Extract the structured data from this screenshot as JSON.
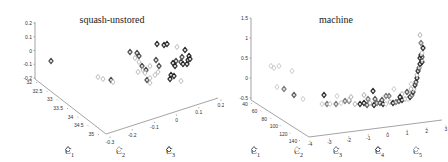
{
  "chart_data": [
    {
      "type": "scatter",
      "subtype": "3d-scatter",
      "title": "squash-unstored",
      "axes": {
        "z": {
          "ticks": [
            "0.2",
            "0.1",
            "0",
            "-0.1",
            "-0.2"
          ],
          "range": [
            -0.2,
            0.2
          ]
        },
        "x": {
          "ticks": [
            "32",
            "32.5",
            "33",
            "33.5",
            "34",
            "34.5",
            "35"
          ],
          "range": [
            32,
            35
          ]
        },
        "y": {
          "ticks": [
            "-0.3",
            "-0.2",
            "-0.1",
            "0",
            "0.1",
            "0.2"
          ],
          "range": [
            -0.3,
            0.2
          ]
        }
      },
      "legend": [
        {
          "label": "C",
          "sub": "1",
          "color": "#444444"
        },
        {
          "label": "C",
          "sub": "2",
          "color": "#aaaaaa"
        },
        {
          "label": "C",
          "sub": "3",
          "color": "#222222"
        }
      ],
      "grid": false
    },
    {
      "type": "scatter",
      "subtype": "3d-scatter",
      "title": "machine",
      "axes": {
        "z": {
          "ticks": [
            "1.5",
            "1",
            "0.5",
            "0",
            "-0.5"
          ],
          "range": [
            -0.5,
            1.5
          ]
        },
        "x": {
          "ticks": [
            "40",
            "60",
            "80",
            "100",
            "120",
            "140"
          ],
          "range": [
            40,
            140
          ]
        },
        "y": {
          "ticks": [
            "-4",
            "-3",
            "-2",
            "-1",
            "0",
            "1",
            "2",
            "3"
          ],
          "range": [
            -4,
            3
          ]
        }
      },
      "legend": [
        {
          "label": "C",
          "sub": "1",
          "color": "#555555"
        },
        {
          "label": "C",
          "sub": "2",
          "color": "#bbbbbb"
        },
        {
          "label": "C",
          "sub": "3",
          "color": "#777777"
        },
        {
          "label": "C",
          "sub": "4",
          "color": "#222222"
        },
        {
          "label": "C",
          "sub": "5",
          "color": "#999999"
        }
      ],
      "grid": false
    }
  ],
  "panels": {
    "left": {
      "title": "squash-unstored"
    },
    "right": {
      "title": "machine"
    }
  }
}
